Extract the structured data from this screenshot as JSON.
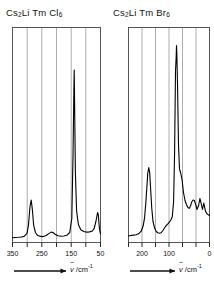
{
  "figure": {
    "kind": "raman-spectra-pair",
    "background_color": "#ffffff",
    "line_color": "#000000",
    "grid_color": "#8a8a8a",
    "frame_color": "#555555"
  },
  "panels": [
    {
      "id": "left",
      "title_html": "Cs<sub>2</sub>Li Tm Cl<sub>6</sub>",
      "title_plain": "Cs2Li Tm Cl6",
      "axis_caption_prefix": "",
      "axis_symbol": "v",
      "axis_unit": "/cm",
      "axis_unit_exponent": "-1",
      "tick_labels": [
        "350",
        "250",
        "150",
        "50"
      ]
    },
    {
      "id": "right",
      "title_html": "Cs<sub>2</sub>Li Tm Br<sub>6</sub>",
      "title_plain": "Cs2Li Tm Br6",
      "axis_caption_prefix": "",
      "axis_symbol": "v",
      "axis_unit": "/cm",
      "axis_unit_exponent": "-1",
      "tick_labels": [
        "200",
        "100",
        "0"
      ]
    }
  ],
  "chart_data": [
    {
      "type": "line",
      "title": "Cs2Li Tm Cl6",
      "xlabel": "wavenumber / cm^-1",
      "ylabel": "Raman intensity (arb. units)",
      "xlim": [
        360,
        35
      ],
      "x_axis_direction": "decreasing-left-to-right",
      "ylim": [
        0,
        1
      ],
      "grid": true,
      "gridlines_x": [
        350,
        300,
        250,
        200,
        150,
        100,
        50
      ],
      "xticks": [
        350,
        250,
        150,
        50
      ],
      "legend": "none",
      "peaks": [
        {
          "center": 296,
          "height": 0.195,
          "width": 5,
          "assignment": "nu2"
        },
        {
          "center": 225,
          "height": 0.045,
          "width": 16,
          "assignment": "broad"
        },
        {
          "center": 150,
          "height": 0.92,
          "width": 3.2,
          "assignment": "nu1"
        },
        {
          "center": 52,
          "height": 0.125,
          "width": 5,
          "assignment": "nu5"
        }
      ],
      "baseline": 0.022,
      "x": [
        360,
        350,
        340,
        330,
        320,
        310,
        305,
        300,
        296,
        292,
        288,
        282,
        275,
        265,
        255,
        245,
        235,
        228,
        222,
        215,
        205,
        195,
        185,
        175,
        165,
        158,
        154,
        151,
        150,
        149,
        146,
        142,
        136,
        128,
        118,
        108,
        98,
        88,
        78,
        70,
        64,
        58,
        54,
        52,
        50,
        46,
        42,
        38,
        35
      ],
      "y": [
        0.02,
        0.021,
        0.022,
        0.023,
        0.026,
        0.04,
        0.08,
        0.165,
        0.195,
        0.15,
        0.08,
        0.045,
        0.032,
        0.027,
        0.026,
        0.03,
        0.04,
        0.046,
        0.044,
        0.036,
        0.029,
        0.027,
        0.028,
        0.032,
        0.045,
        0.11,
        0.4,
        0.82,
        0.92,
        0.8,
        0.38,
        0.14,
        0.062,
        0.038,
        0.03,
        0.027,
        0.026,
        0.027,
        0.03,
        0.036,
        0.048,
        0.08,
        0.11,
        0.125,
        0.11,
        0.06,
        0.035,
        0.026,
        0.024
      ]
    },
    {
      "type": "line",
      "title": "Cs2Li Tm Br6",
      "xlabel": "wavenumber / cm^-1",
      "ylabel": "Raman intensity (arb. units)",
      "xlim": [
        245,
        -5
      ],
      "x_axis_direction": "decreasing-left-to-right",
      "ylim": [
        0,
        1
      ],
      "grid": true,
      "gridlines_x": [
        225,
        200,
        150,
        100,
        50,
        10
      ],
      "xticks": [
        200,
        100,
        0
      ],
      "legend": "none",
      "peaks": [
        {
          "center": 183,
          "height": 0.355,
          "width": 4.5,
          "assignment": "nu2"
        },
        {
          "center": 130,
          "height": 0.075,
          "width": 10,
          "assignment": "shoulder"
        },
        {
          "center": 97,
          "height": 0.95,
          "width": 3.0,
          "assignment": "nu1"
        },
        {
          "center": 85,
          "height": 0.23,
          "width": 6,
          "assignment": "shoulder"
        },
        {
          "center": 45,
          "height": 0.105,
          "width": 5,
          "assignment": "nu5"
        },
        {
          "center": 28,
          "height": 0.095,
          "width": 5,
          "assignment": "lattice"
        },
        {
          "center": 14,
          "height": 0.105,
          "width": 5,
          "assignment": "lattice"
        }
      ],
      "baseline": 0.03,
      "x": [
        245,
        238,
        230,
        222,
        214,
        206,
        200,
        196,
        192,
        189,
        186,
        183,
        180,
        177,
        174,
        170,
        165,
        160,
        155,
        150,
        145,
        140,
        134,
        130,
        126,
        122,
        118,
        114,
        110,
        106,
        103,
        100,
        98,
        97,
        96,
        94,
        91,
        88,
        85,
        82,
        78,
        74,
        70,
        66,
        62,
        58,
        54,
        50,
        46,
        43,
        40,
        36,
        32,
        28,
        25,
        22,
        18,
        14,
        10,
        6,
        2,
        -3
      ],
      "y": [
        0.028,
        0.03,
        0.032,
        0.034,
        0.038,
        0.05,
        0.075,
        0.11,
        0.18,
        0.26,
        0.33,
        0.355,
        0.33,
        0.25,
        0.17,
        0.105,
        0.066,
        0.05,
        0.044,
        0.042,
        0.044,
        0.052,
        0.066,
        0.075,
        0.082,
        0.088,
        0.096,
        0.105,
        0.12,
        0.19,
        0.42,
        0.8,
        0.93,
        0.95,
        0.9,
        0.62,
        0.33,
        0.25,
        0.23,
        0.2,
        0.15,
        0.11,
        0.09,
        0.078,
        0.074,
        0.08,
        0.092,
        0.1,
        0.103,
        0.1,
        0.086,
        0.07,
        0.078,
        0.095,
        0.086,
        0.07,
        0.082,
        0.105,
        0.09,
        0.072,
        0.066,
        0.062
      ]
    }
  ]
}
